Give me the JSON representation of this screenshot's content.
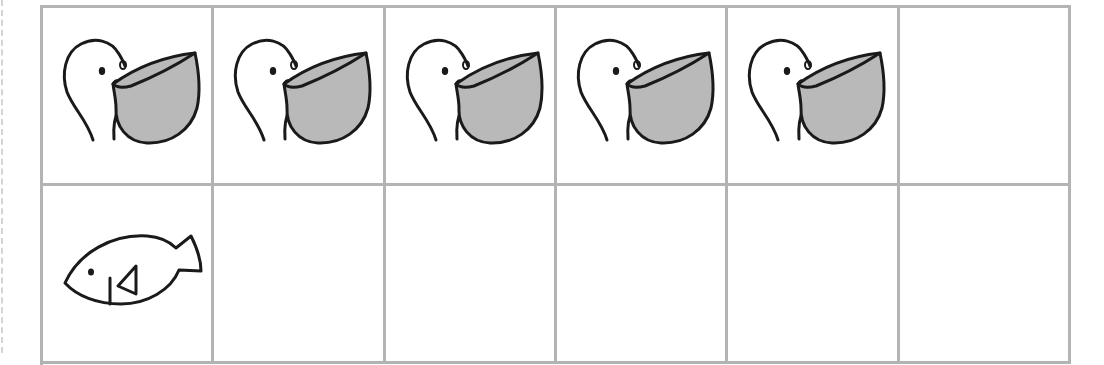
{
  "worksheet": {
    "type": "counting-frame",
    "columns": 6,
    "rows_visible": 2,
    "colors": {
      "grid_line": "#b3b3b3",
      "outline": "#1a1a1a",
      "pouch_fill": "#b9b9b9",
      "background": "#ffffff",
      "margin_dash": "#d4d4d4"
    },
    "rows": [
      {
        "cells": [
          {
            "icon": "pelican-icon"
          },
          {
            "icon": "pelican-icon"
          },
          {
            "icon": "pelican-icon"
          },
          {
            "icon": "pelican-icon"
          },
          {
            "icon": "pelican-icon"
          },
          {
            "icon": null
          }
        ]
      },
      {
        "cells": [
          {
            "icon": "fish-icon"
          },
          {
            "icon": null
          },
          {
            "icon": null
          },
          {
            "icon": null
          },
          {
            "icon": null
          },
          {
            "icon": null
          }
        ]
      }
    ],
    "counts": {
      "pelicans": 5,
      "fish": 1
    }
  }
}
